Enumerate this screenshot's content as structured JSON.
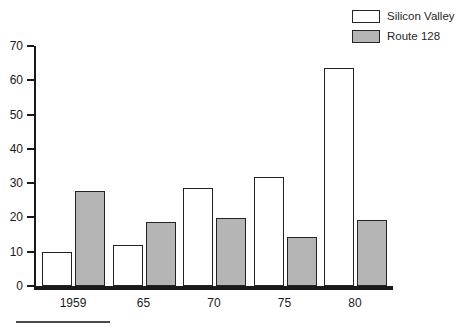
{
  "chart_data": {
    "type": "bar",
    "title": "",
    "subtitle": "",
    "xlabel": "",
    "ylabel": "",
    "categories": [
      "1959",
      "65",
      "70",
      "75",
      "80"
    ],
    "series": [
      {
        "name": "Silicon Valley",
        "fill": "#ffffff",
        "values": [
          9.8,
          12.0,
          28.7,
          31.8,
          63.6
        ]
      },
      {
        "name": "Route 128",
        "fill": "#b5b5b5",
        "values": [
          27.7,
          18.7,
          19.8,
          14.2,
          19.3
        ]
      }
    ],
    "ylim": [
      0,
      70
    ],
    "ytick_labels": [
      "0",
      "10",
      "20",
      "30",
      "40",
      "50",
      "60",
      "70"
    ],
    "ytick_values": [
      0,
      10,
      20,
      30,
      40,
      50,
      60,
      70
    ],
    "xtick_labels": [
      "1959",
      "65",
      "70",
      "75",
      "80"
    ],
    "grid": false,
    "legend_position": "top-right",
    "annotations": []
  },
  "legend": {
    "entries": [
      {
        "label": "Silicon Valley",
        "swatch": "empty"
      },
      {
        "label": "Route 128",
        "swatch": "filled"
      }
    ]
  },
  "colors": {
    "axis": "#1a1a1a",
    "bar_outline": "#232323",
    "route128_fill": "#b5b5b5",
    "silicon_valley_fill": "#ffffff",
    "rule": "#4a4a4a"
  }
}
